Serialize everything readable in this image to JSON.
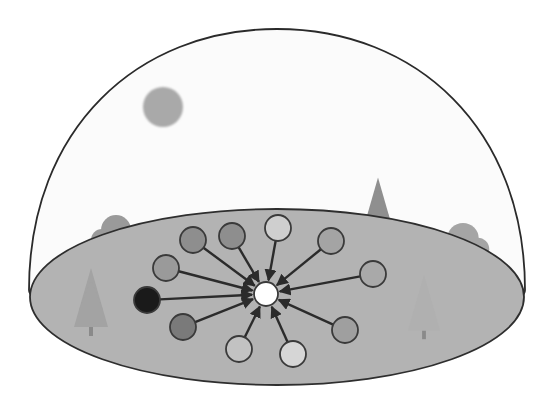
{
  "diagram": {
    "title": "Hub-and-spoke network under a dome",
    "colors": {
      "background": "#ffffff",
      "dome_fill": "#fbfbfb",
      "dome_stroke": "#2a2a2a",
      "ground_fill": "#b3b3b3",
      "ground_stroke": "#2e2e2e",
      "sun": "#a9a9a9",
      "edge": "#2b2b2b",
      "node_stroke": "#3a3a3a",
      "tree_dark": "#8f8f8f",
      "tree_mid": "#a2a2a2",
      "tree_light": "#b7b7b7"
    },
    "dome": {
      "cx": 277,
      "base_y": 290,
      "rx": 248,
      "top_y": 29
    },
    "ground": {
      "cx": 277,
      "cy": 297,
      "rx": 247,
      "ry": 88
    },
    "sun": {
      "cx": 163,
      "cy": 107,
      "r": 20
    },
    "hub": {
      "cx": 266,
      "cy": 294,
      "r": 12,
      "fill": "#ffffff"
    },
    "nodes": [
      {
        "id": "n1",
        "cx": 193,
        "cy": 240,
        "r": 13,
        "fill": "#8e8e8e"
      },
      {
        "id": "n2",
        "cx": 232,
        "cy": 236,
        "r": 13,
        "fill": "#8e8e8e"
      },
      {
        "id": "n3",
        "cx": 278,
        "cy": 228,
        "r": 13,
        "fill": "#cfcfcf"
      },
      {
        "id": "n4",
        "cx": 331,
        "cy": 241,
        "r": 13,
        "fill": "#a4a4a4"
      },
      {
        "id": "n5",
        "cx": 373,
        "cy": 274,
        "r": 13,
        "fill": "#a9a9a9"
      },
      {
        "id": "n6",
        "cx": 166,
        "cy": 268,
        "r": 13,
        "fill": "#9a9a9a"
      },
      {
        "id": "n7",
        "cx": 147,
        "cy": 300,
        "r": 13,
        "fill": "#1a1a1a"
      },
      {
        "id": "n8",
        "cx": 183,
        "cy": 327,
        "r": 13,
        "fill": "#7a7a7a"
      },
      {
        "id": "n9",
        "cx": 345,
        "cy": 330,
        "r": 13,
        "fill": "#9f9f9f"
      },
      {
        "id": "n10",
        "cx": 239,
        "cy": 349,
        "r": 13,
        "fill": "#c2c2c2"
      },
      {
        "id": "n11",
        "cx": 293,
        "cy": 354,
        "r": 13,
        "fill": "#d6d6d6"
      }
    ],
    "trees": [
      {
        "id": "t1",
        "kind": "round",
        "x": 116,
        "y": 236,
        "scale": 1.0,
        "fill": "#9a9a9a"
      },
      {
        "id": "t2",
        "kind": "conifer",
        "x": 91,
        "y": 300,
        "scale": 1.0,
        "fill": "#a3a3a3"
      },
      {
        "id": "t3",
        "kind": "conifer",
        "x": 378,
        "y": 208,
        "scale": 0.95,
        "fill": "#8f8f8f"
      },
      {
        "id": "t4",
        "kind": "round",
        "x": 463,
        "y": 245,
        "scale": 1.05,
        "fill": "#a5a5a5"
      },
      {
        "id": "t5",
        "kind": "conifer",
        "x": 424,
        "y": 305,
        "scale": 0.95,
        "fill": "#b0b0b0"
      }
    ]
  }
}
